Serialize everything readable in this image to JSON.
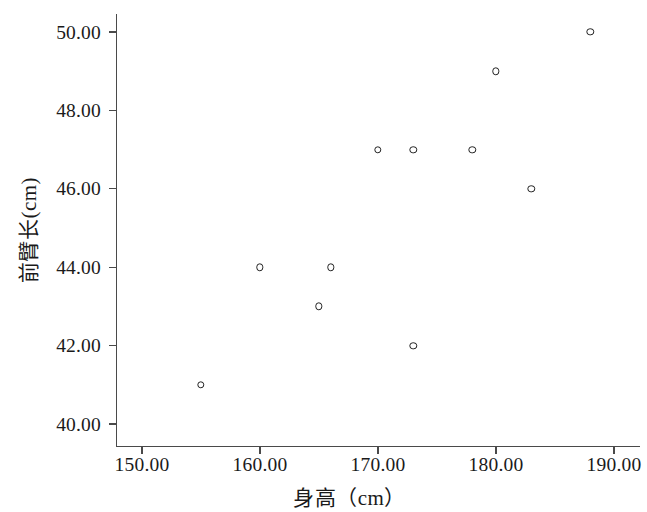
{
  "chart_data": {
    "type": "scatter",
    "title": "",
    "xlabel": "身高（cm）",
    "ylabel": "前臂长(cm)",
    "xlim": [
      145.5,
      192.0
    ],
    "ylim": [
      39.45,
      50.55
    ],
    "xticks": [
      150,
      160,
      170,
      180,
      190
    ],
    "yticks": [
      40,
      42,
      44,
      46,
      48,
      50
    ],
    "xticklabels": [
      "150.00",
      "160.00",
      "170.00",
      "180.00",
      "190.00"
    ],
    "yticklabels": [
      "40.00",
      "42.00",
      "44.00",
      "46.00",
      "48.00",
      "50.00"
    ],
    "grid": false,
    "legend": null,
    "marker": "open-circle",
    "marker_color": "#222222",
    "x": [
      155,
      160,
      165,
      166,
      170,
      173,
      173,
      178,
      180,
      183,
      188
    ],
    "y": [
      41,
      44,
      43,
      44,
      47,
      47,
      42,
      47,
      49,
      46,
      50
    ],
    "points": [
      {
        "x": 155,
        "y": 41
      },
      {
        "x": 160,
        "y": 44
      },
      {
        "x": 165,
        "y": 43
      },
      {
        "x": 166,
        "y": 44
      },
      {
        "x": 170,
        "y": 47
      },
      {
        "x": 173,
        "y": 47
      },
      {
        "x": 173,
        "y": 42
      },
      {
        "x": 178,
        "y": 47
      },
      {
        "x": 180,
        "y": 49
      },
      {
        "x": 183,
        "y": 46
      },
      {
        "x": 188,
        "y": 50
      }
    ]
  },
  "colors": {
    "background": "#ffffff",
    "axis": "#4a4a4a",
    "text": "#1a1a1a",
    "marker": "#222222"
  }
}
